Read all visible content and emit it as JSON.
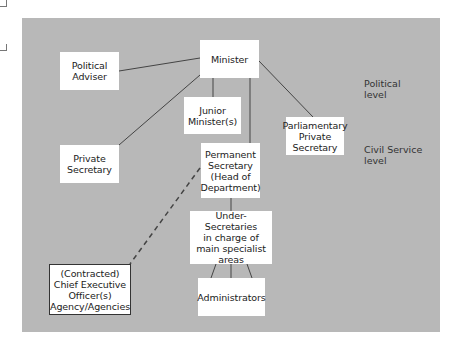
{
  "diagram": {
    "type": "organisation-chart",
    "nodes": [
      {
        "id": "minister",
        "label": "Minister"
      },
      {
        "id": "political_adviser",
        "label": "Political\nAdviser"
      },
      {
        "id": "junior_minister",
        "label": "Junior\nMinister(s)"
      },
      {
        "id": "private_secretary",
        "label": "Private\nSecretary"
      },
      {
        "id": "parliamentary_private_secretary",
        "label": "Parliamentary\nPrivate\nSecretary"
      },
      {
        "id": "permanent_secretary",
        "label": "Permanent\nSecretary\n(Head of\nDepartment)"
      },
      {
        "id": "under_secretaries",
        "label": "Under-Secretaries\nin charge of\nmain specialist\nareas"
      },
      {
        "id": "administrators",
        "label": "Administrators"
      },
      {
        "id": "chief_executive",
        "label": "(Contracted)\nChief Executive\nOfficer(s)\nAgency/Agencies"
      }
    ],
    "edges": [
      {
        "from": "minister",
        "to": "political_adviser",
        "style": "solid"
      },
      {
        "from": "minister",
        "to": "private_secretary",
        "style": "solid"
      },
      {
        "from": "minister",
        "to": "junior_minister",
        "style": "solid"
      },
      {
        "from": "minister",
        "to": "permanent_secretary",
        "style": "solid"
      },
      {
        "from": "minister",
        "to": "parliamentary_private_secretary",
        "style": "solid"
      },
      {
        "from": "permanent_secretary",
        "to": "under_secretaries",
        "style": "solid"
      },
      {
        "from": "under_secretaries",
        "to": "administrators",
        "style": "solid",
        "count": 3
      },
      {
        "from": "permanent_secretary",
        "to": "chief_executive",
        "style": "dashed"
      }
    ],
    "levels": [
      {
        "id": "political",
        "label": "Political\nlevel"
      },
      {
        "id": "civil_service",
        "label": "Civil Service\nlevel"
      }
    ]
  }
}
